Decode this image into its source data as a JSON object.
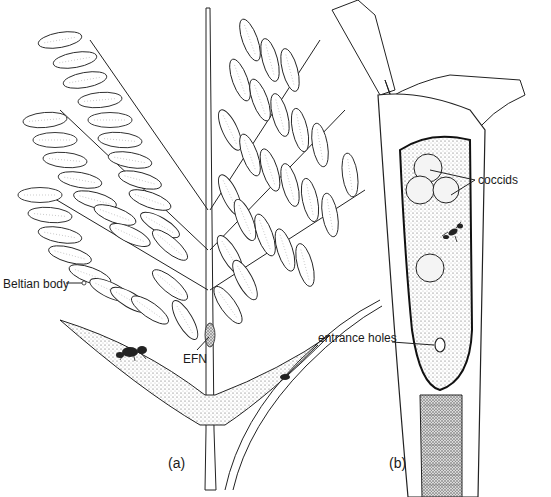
{
  "figure": {
    "panels": [
      {
        "id": "a",
        "label": "(a)"
      },
      {
        "id": "b",
        "label": "(b)"
      }
    ],
    "annotations": {
      "beltian_body": "Beltian body",
      "efn": "EFN",
      "entrance_holes": "entrance holes",
      "coccids": "coccids"
    }
  }
}
